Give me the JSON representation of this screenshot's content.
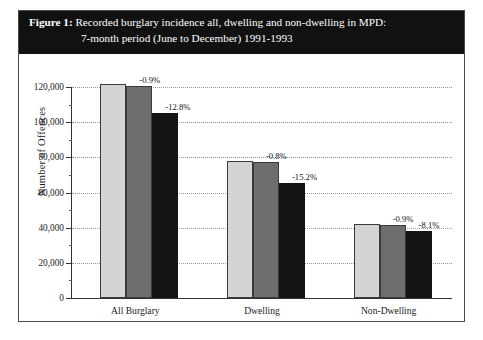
{
  "figure": {
    "label": "Figure 1:",
    "title_line_1": "Recorded burglary incidence all, dwelling and non-dwelling in MPD:",
    "title_line_2": "7-month period (June to December) 1991-1993"
  },
  "colors": {
    "y1991": "#d4d4d4",
    "y1992": "#6e6e6e",
    "y1993": "#141414",
    "banner": "#111111",
    "frame": "#4a4a4a",
    "grid": "#9a9a9a"
  },
  "chart_data": {
    "type": "bar",
    "title": "Recorded burglary incidence all, dwelling and non-dwelling in MPD: 7-month period (June to December) 1991-1993",
    "xlabel": "",
    "ylabel": "Number of Offences",
    "ylim": [
      0,
      120000
    ],
    "ytick_step": 20000,
    "yminor_step": 10000,
    "grid": true,
    "legend_position": "bottom",
    "categories": [
      "All Burglary",
      "Dwelling",
      "Non-Dwelling"
    ],
    "ytick_labels": [
      "0",
      "20,000",
      "40,000",
      "60,000",
      "80,000",
      "100,000",
      "120,000"
    ],
    "ytick_values": [
      0,
      20000,
      40000,
      60000,
      80000,
      100000,
      120000
    ],
    "series": [
      {
        "name": "1991",
        "color": "#d4d4d4",
        "values": [
          121500,
          78000,
          42000
        ]
      },
      {
        "name": "1992",
        "color": "#6e6e6e",
        "values": [
          120400,
          77400,
          41600
        ]
      },
      {
        "name": "1993",
        "color": "#141414",
        "values": [
          105000,
          65600,
          38200
        ]
      }
    ],
    "annotations": [
      {
        "category": "All Burglary",
        "series": "1992",
        "text": "-0.9%"
      },
      {
        "category": "All Burglary",
        "series": "1993",
        "text": "-12.8%"
      },
      {
        "category": "Dwelling",
        "series": "1992",
        "text": "-0.8%"
      },
      {
        "category": "Dwelling",
        "series": "1993",
        "text": "-15.2%"
      },
      {
        "category": "Non-Dwelling",
        "series": "1992",
        "text": "-0.9%"
      },
      {
        "category": "Non-Dwelling",
        "series": "1993",
        "text": "-8.1%"
      }
    ]
  }
}
